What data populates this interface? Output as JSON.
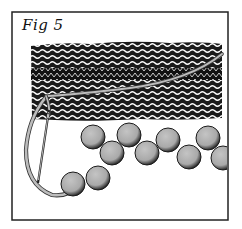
{
  "figure": {
    "caption": "Fig 5",
    "frame": {
      "x": 12,
      "y": 12,
      "width": 216,
      "height": 208,
      "stroke": "#222222"
    },
    "fabric": {
      "x": 30,
      "y": 43,
      "width": 192,
      "height": 78,
      "ridge_band_y": 68,
      "ridge_band_height": 12,
      "fill": "#1a1a1a",
      "stitch_color": "#ffffff"
    },
    "yarn": {
      "color": "#b8b8b8",
      "outline": "#333333"
    },
    "needle": {
      "from": [
        49,
        112
      ],
      "to": [
        38,
        182
      ],
      "color": "#222222"
    },
    "beads": {
      "fill": "#b3b3b3",
      "shadow": "#333333",
      "radius": 12,
      "positions": [
        [
          73,
          184
        ],
        [
          98,
          178
        ],
        [
          93,
          137
        ],
        [
          112,
          153
        ],
        [
          129,
          135
        ],
        [
          147,
          153
        ],
        [
          168,
          140
        ],
        [
          189,
          157
        ],
        [
          208,
          138
        ],
        [
          223,
          158
        ]
      ]
    }
  }
}
